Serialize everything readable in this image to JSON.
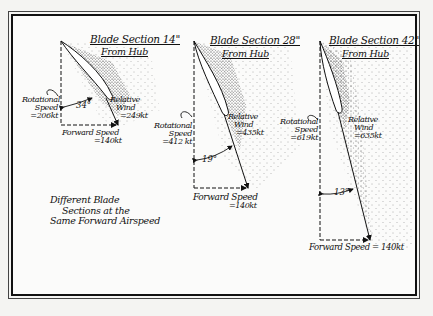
{
  "figure": {
    "caption_lines": [
      "Different Blade",
      "Sections at the",
      "Same Forward Airspeed"
    ]
  },
  "sections": [
    {
      "title": "Blade Section 14\"",
      "subtitle": "From Hub",
      "rotational_label": [
        "Rotational",
        "Speed",
        "=206kt"
      ],
      "relative_label": [
        "Relative",
        "Wind",
        "=249kt"
      ],
      "forward_label": [
        "Forward Speed",
        "=140kt"
      ],
      "angle": "34°"
    },
    {
      "title": "Blade Section 28\"",
      "subtitle": "From Hub",
      "rotational_label": [
        "Rotational",
        "Speed",
        "=412 kt"
      ],
      "relative_label": [
        "Relative",
        "Wind",
        "=435kt"
      ],
      "forward_label": [
        "Forward Speed",
        "=140kt"
      ],
      "angle": "19°"
    },
    {
      "title": "Blade Section 42\"",
      "subtitle": "From Hub",
      "rotational_label": [
        "Rotational",
        "Speed",
        "=619kt"
      ],
      "relative_label": [
        "Relative",
        "Wind",
        "=635kt"
      ],
      "forward_label": [
        "Forward Speed = 140kt"
      ],
      "angle": "13°"
    }
  ],
  "colors": {
    "ink": "#111111",
    "paper": "#fbfbfa",
    "stipple": "#222222"
  }
}
